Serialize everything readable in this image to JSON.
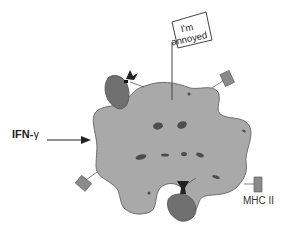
{
  "diagram": {
    "flag": {
      "line1": "I'm",
      "line2": "annoyed"
    },
    "input_label": {
      "prefix": "IFN-",
      "symbol": "γ"
    },
    "receptor_label": "MHC II",
    "colors": {
      "cell_fill": "#a9a9a9",
      "cell_stroke": "#6e6e6e",
      "organelle": "#4d4d4d",
      "tcell_fill": "#6f6f6f",
      "receptor": "#8a8a8a",
      "text": "#222222"
    }
  }
}
